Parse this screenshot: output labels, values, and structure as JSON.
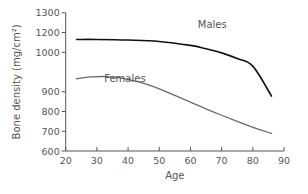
{
  "chart_data": {
    "type": "line",
    "title": "",
    "xlabel": "Age",
    "ylabel": "Bone density (mg/cm²)",
    "xlim": [
      20,
      90
    ],
    "ylim": [
      600,
      1300
    ],
    "grid": false,
    "legend": "inline labels",
    "x_ticks": [
      20,
      30,
      40,
      50,
      60,
      70,
      80,
      90
    ],
    "y_ticks": [
      600,
      700,
      800,
      900,
      1100,
      1200,
      1300
    ],
    "y_tick_labels": [
      "600",
      "700",
      "800",
      "900",
      "1000",
      "1200",
      "1300"
    ],
    "series": [
      {
        "name": "Males",
        "color": "#111111",
        "x": [
          23.5,
          30,
          40,
          50,
          60,
          65,
          70,
          75,
          80,
          86
        ],
        "values": [
          1165,
          1165,
          1162,
          1155,
          1135,
          1118,
          1097,
          1068,
          1030,
          878
        ]
      },
      {
        "name": "Females",
        "color": "#6a6a6a",
        "x": [
          23.5,
          28,
          33,
          38,
          45,
          50,
          55,
          60,
          65,
          70,
          75,
          80,
          86
        ],
        "values": [
          966,
          975,
          977,
          969,
          942,
          915,
          882,
          848,
          813,
          781,
          750,
          720,
          689
        ]
      }
    ],
    "annotations": [
      {
        "text": "Males",
        "x": 67,
        "y": 1225
      },
      {
        "text": "Females",
        "x": 39,
        "y": 950
      }
    ]
  }
}
